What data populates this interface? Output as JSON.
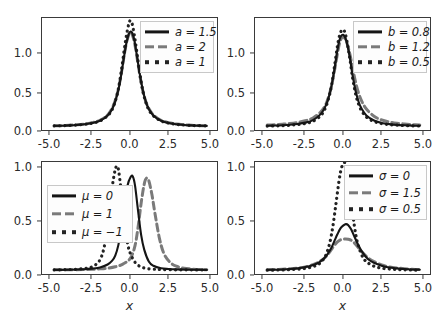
{
  "figure": {
    "background_color": "#ffffff",
    "layout": "2x2 grid of line plots",
    "axis_color": "#3a3a3a"
  },
  "colors": {
    "solid": "#151515",
    "dashed": "#7a7a7a",
    "dotted": "#232323",
    "frame": "#3a3a3a",
    "legend_border": "#c8c8c8",
    "legend_face": "#fdfdfd"
  },
  "chart_data": [
    {
      "type": "line",
      "panel": "top-left",
      "title": "",
      "xlabel": "",
      "ylabel": "",
      "xlim": [
        -5.8,
        5.8
      ],
      "ylim": [
        -0.06,
        1.28
      ],
      "grid": false,
      "legend_position": "upper right",
      "xticks": [
        "-5.0",
        "-2.5",
        "0.0",
        "2.5",
        "5.0"
      ],
      "xtick_values": [
        -5.0,
        -2.5,
        0.0,
        2.5,
        5.0
      ],
      "yticks": [
        "0.0",
        "0.5",
        "1.0"
      ],
      "ytick_values": [
        0.0,
        0.5,
        1.0
      ],
      "series": [
        {
          "name": "a = 1.5",
          "style": "solid",
          "color": "#151515",
          "x": [
            -5.0,
            -4.5,
            -4.0,
            -3.5,
            -3.0,
            -2.5,
            -2.0,
            -1.5,
            -1.2,
            -1.0,
            -0.8,
            -0.6,
            -0.4,
            -0.25,
            -0.1,
            0.0,
            0.1,
            0.25,
            0.4,
            0.6,
            0.8,
            1.0,
            1.2,
            1.5,
            2.0,
            2.5,
            3.0,
            3.5,
            4.0,
            4.5,
            5.0
          ],
          "y": [
            0.012,
            0.014,
            0.018,
            0.023,
            0.031,
            0.045,
            0.072,
            0.135,
            0.21,
            0.3,
            0.43,
            0.62,
            0.85,
            1.0,
            1.1,
            1.12,
            1.11,
            1.02,
            0.86,
            0.63,
            0.44,
            0.3,
            0.21,
            0.135,
            0.072,
            0.045,
            0.031,
            0.023,
            0.018,
            0.014,
            0.012
          ]
        },
        {
          "name": "a = 2",
          "style": "dashed",
          "color": "#7a7a7a",
          "x": [
            -5.0,
            -4.5,
            -4.0,
            -3.5,
            -3.0,
            -2.5,
            -2.0,
            -1.5,
            -1.2,
            -1.0,
            -0.8,
            -0.6,
            -0.4,
            -0.25,
            -0.1,
            0.0,
            0.1,
            0.25,
            0.4,
            0.6,
            0.8,
            1.0,
            1.2,
            1.5,
            2.0,
            2.5,
            3.0,
            3.5,
            4.0,
            4.5,
            5.0
          ],
          "y": [
            0.013,
            0.015,
            0.019,
            0.025,
            0.034,
            0.05,
            0.078,
            0.14,
            0.22,
            0.31,
            0.44,
            0.63,
            0.86,
            1.0,
            1.09,
            1.1,
            1.09,
            1.0,
            0.85,
            0.62,
            0.43,
            0.3,
            0.215,
            0.14,
            0.078,
            0.05,
            0.034,
            0.025,
            0.019,
            0.015,
            0.013
          ]
        },
        {
          "name": "a = 1",
          "style": "dotted",
          "color": "#232323",
          "x": [
            -5.0,
            -4.5,
            -4.0,
            -3.5,
            -3.0,
            -2.5,
            -2.0,
            -1.5,
            -1.2,
            -1.0,
            -0.8,
            -0.6,
            -0.4,
            -0.25,
            -0.1,
            0.0,
            0.1,
            0.25,
            0.4,
            0.6,
            0.8,
            1.0,
            1.2,
            1.5,
            2.0,
            2.5,
            3.0,
            3.5,
            4.0,
            4.5,
            5.0
          ],
          "y": [
            0.012,
            0.014,
            0.017,
            0.022,
            0.03,
            0.044,
            0.07,
            0.13,
            0.205,
            0.3,
            0.44,
            0.66,
            0.92,
            1.09,
            1.22,
            1.25,
            1.22,
            1.08,
            0.9,
            0.64,
            0.43,
            0.29,
            0.2,
            0.13,
            0.07,
            0.044,
            0.03,
            0.022,
            0.017,
            0.014,
            0.012
          ]
        }
      ]
    },
    {
      "type": "line",
      "panel": "top-right",
      "title": "",
      "xlabel": "",
      "ylabel": "",
      "xlim": [
        -5.8,
        5.8
      ],
      "ylim": [
        -0.06,
        1.28
      ],
      "grid": false,
      "legend_position": "upper right",
      "xticks": [
        "-5.0",
        "-2.5",
        "0.0",
        "2.5",
        "5.0"
      ],
      "xtick_values": [
        -5.0,
        -2.5,
        0.0,
        2.5,
        5.0
      ],
      "yticks": [
        "0.0",
        "0.5",
        "1.0"
      ],
      "ytick_values": [
        0.0,
        0.5,
        1.0
      ],
      "series": [
        {
          "name": "b = 0.8",
          "style": "solid",
          "color": "#151515",
          "x": [
            -5.0,
            -4.5,
            -4.0,
            -3.5,
            -3.0,
            -2.5,
            -2.0,
            -1.5,
            -1.2,
            -1.0,
            -0.8,
            -0.6,
            -0.4,
            -0.25,
            -0.1,
            0.05,
            0.2,
            0.4,
            0.6,
            0.8,
            1.0,
            1.2,
            1.5,
            2.0,
            2.5,
            3.0,
            3.5,
            4.0,
            4.5,
            5.0
          ],
          "y": [
            0.013,
            0.016,
            0.02,
            0.026,
            0.035,
            0.05,
            0.08,
            0.15,
            0.235,
            0.33,
            0.47,
            0.67,
            0.9,
            1.03,
            1.08,
            1.07,
            1.0,
            0.83,
            0.6,
            0.42,
            0.29,
            0.21,
            0.135,
            0.075,
            0.047,
            0.033,
            0.024,
            0.019,
            0.015,
            0.013
          ]
        },
        {
          "name": "b = 1.2",
          "style": "dashed",
          "color": "#7a7a7a",
          "x": [
            -5.0,
            -4.5,
            -4.0,
            -3.5,
            -3.0,
            -2.5,
            -2.0,
            -1.5,
            -1.2,
            -1.0,
            -0.8,
            -0.6,
            -0.4,
            -0.25,
            -0.1,
            0.05,
            0.2,
            0.4,
            0.6,
            0.8,
            1.0,
            1.2,
            1.5,
            2.0,
            2.5,
            3.0,
            3.5,
            4.0,
            4.5,
            5.0
          ],
          "y": [
            0.022,
            0.026,
            0.032,
            0.04,
            0.053,
            0.072,
            0.105,
            0.175,
            0.25,
            0.34,
            0.47,
            0.65,
            0.86,
            0.99,
            1.05,
            1.05,
            1.0,
            0.87,
            0.69,
            0.52,
            0.39,
            0.3,
            0.21,
            0.125,
            0.082,
            0.058,
            0.043,
            0.034,
            0.027,
            0.022
          ]
        },
        {
          "name": "b = 0.5",
          "style": "dotted",
          "color": "#232323",
          "x": [
            -5.0,
            -4.5,
            -4.0,
            -3.5,
            -3.0,
            -2.5,
            -2.0,
            -1.5,
            -1.2,
            -1.0,
            -0.8,
            -0.6,
            -0.4,
            -0.25,
            -0.1,
            0.05,
            0.2,
            0.4,
            0.6,
            0.8,
            1.0,
            1.2,
            1.5,
            2.0,
            2.5,
            3.0,
            3.5,
            4.0,
            4.5,
            5.0
          ],
          "y": [
            0.01,
            0.012,
            0.015,
            0.02,
            0.027,
            0.04,
            0.066,
            0.13,
            0.215,
            0.32,
            0.47,
            0.7,
            0.95,
            1.08,
            1.14,
            1.13,
            1.03,
            0.82,
            0.57,
            0.38,
            0.26,
            0.185,
            0.115,
            0.063,
            0.039,
            0.027,
            0.02,
            0.015,
            0.012,
            0.01
          ]
        }
      ]
    },
    {
      "type": "line",
      "panel": "bottom-left",
      "title": "",
      "xlabel": "x",
      "ylabel": "",
      "xlim": [
        -5.8,
        5.8
      ],
      "ylim": [
        -0.06,
        1.28
      ],
      "grid": false,
      "legend_position": "upper left",
      "xticks": [
        "-5.0",
        "-2.5",
        "0.0",
        "2.5",
        "5.0"
      ],
      "xtick_values": [
        -5.0,
        -2.5,
        0.0,
        2.5,
        5.0
      ],
      "yticks": [
        "0.0",
        "0.5",
        "1.0"
      ],
      "ytick_values": [
        0.0,
        0.5,
        1.0
      ],
      "series": [
        {
          "name": "μ = 0",
          "style": "solid",
          "color": "#151515",
          "x": [
            -5.0,
            -4.0,
            -3.0,
            -2.5,
            -2.0,
            -1.5,
            -1.2,
            -1.0,
            -0.8,
            -0.6,
            -0.4,
            -0.2,
            0.0,
            0.15,
            0.3,
            0.5,
            0.7,
            0.9,
            1.2,
            1.5,
            2.0,
            2.5,
            3.0,
            4.0,
            5.0
          ],
          "y": [
            0.012,
            0.014,
            0.02,
            0.027,
            0.04,
            0.075,
            0.12,
            0.18,
            0.3,
            0.5,
            0.78,
            1.0,
            1.1,
            1.11,
            1.0,
            0.7,
            0.42,
            0.25,
            0.11,
            0.06,
            0.03,
            0.022,
            0.018,
            0.014,
            0.012
          ]
        },
        {
          "name": "μ = 1",
          "style": "dashed",
          "color": "#7a7a7a",
          "x": [
            -5.0,
            -4.0,
            -3.0,
            -2.5,
            -2.0,
            -1.5,
            -1.0,
            -0.5,
            0.0,
            0.3,
            0.5,
            0.7,
            0.9,
            1.05,
            1.2,
            1.4,
            1.6,
            1.9,
            2.2,
            2.6,
            3.0,
            3.5,
            4.0,
            4.5,
            5.0
          ],
          "y": [
            0.012,
            0.013,
            0.016,
            0.019,
            0.024,
            0.032,
            0.048,
            0.08,
            0.15,
            0.3,
            0.52,
            0.8,
            1.02,
            1.09,
            1.06,
            0.9,
            0.68,
            0.38,
            0.2,
            0.1,
            0.055,
            0.032,
            0.022,
            0.016,
            0.013
          ]
        },
        {
          "name": "μ = −1",
          "style": "dotted",
          "color": "#232323",
          "x": [
            -5.0,
            -4.5,
            -4.0,
            -3.5,
            -3.0,
            -2.6,
            -2.3,
            -2.0,
            -1.75,
            -1.5,
            -1.3,
            -1.1,
            -0.95,
            -0.8,
            -0.6,
            -0.4,
            -0.2,
            0.0,
            0.3,
            0.6,
            1.0,
            1.5,
            2.0,
            3.0,
            4.0,
            5.0
          ],
          "y": [
            0.012,
            0.013,
            0.016,
            0.02,
            0.028,
            0.042,
            0.07,
            0.13,
            0.26,
            0.52,
            0.85,
            1.1,
            1.22,
            1.2,
            0.92,
            0.6,
            0.33,
            0.2,
            0.1,
            0.055,
            0.03,
            0.02,
            0.016,
            0.013,
            0.012,
            0.012
          ]
        }
      ]
    },
    {
      "type": "line",
      "panel": "bottom-right",
      "title": "",
      "xlabel": "x",
      "ylabel": "",
      "xlim": [
        -5.8,
        5.8
      ],
      "ylim": [
        -0.06,
        1.28
      ],
      "grid": false,
      "legend_position": "upper right",
      "xticks": [
        "-5.0",
        "-2.5",
        "0.0",
        "2.5",
        "5.0"
      ],
      "xtick_values": [
        -5.0,
        -2.5,
        0.0,
        2.5,
        5.0
      ],
      "yticks": [
        "0.0",
        "0.5",
        "1.0"
      ],
      "ytick_values": [
        0.0,
        0.5,
        1.0
      ],
      "series": [
        {
          "name": "σ = 0",
          "style": "solid",
          "color": "#151515",
          "x": [
            -5.0,
            -4.5,
            -4.0,
            -3.5,
            -3.0,
            -2.5,
            -2.0,
            -1.6,
            -1.2,
            -1.0,
            -0.8,
            -0.6,
            -0.4,
            -0.2,
            0.0,
            0.15,
            0.3,
            0.5,
            0.7,
            0.9,
            1.2,
            1.6,
            2.0,
            2.5,
            3.0,
            3.5,
            4.0,
            4.5,
            5.0
          ],
          "y": [
            0.012,
            0.014,
            0.017,
            0.022,
            0.03,
            0.045,
            0.07,
            0.1,
            0.16,
            0.21,
            0.27,
            0.35,
            0.43,
            0.5,
            0.535,
            0.55,
            0.54,
            0.49,
            0.41,
            0.33,
            0.23,
            0.14,
            0.095,
            0.06,
            0.04,
            0.03,
            0.022,
            0.017,
            0.014
          ]
        },
        {
          "name": "σ = 1.5",
          "style": "dashed",
          "color": "#7a7a7a",
          "x": [
            -5.0,
            -4.5,
            -4.0,
            -3.5,
            -3.0,
            -2.5,
            -2.0,
            -1.6,
            -1.2,
            -1.0,
            -0.8,
            -0.6,
            -0.4,
            -0.2,
            0.0,
            0.15,
            0.3,
            0.5,
            0.7,
            0.9,
            1.2,
            1.6,
            2.0,
            2.5,
            3.0,
            3.5,
            4.0,
            4.5,
            5.0
          ],
          "y": [
            0.014,
            0.016,
            0.02,
            0.025,
            0.033,
            0.047,
            0.073,
            0.105,
            0.16,
            0.2,
            0.25,
            0.3,
            0.34,
            0.365,
            0.372,
            0.375,
            0.372,
            0.36,
            0.33,
            0.29,
            0.225,
            0.155,
            0.11,
            0.07,
            0.048,
            0.035,
            0.026,
            0.02,
            0.016
          ]
        },
        {
          "name": "σ = 0.5",
          "style": "dotted",
          "color": "#232323",
          "x": [
            -5.0,
            -4.5,
            -4.0,
            -3.5,
            -3.0,
            -2.5,
            -2.0,
            -1.6,
            -1.3,
            -1.1,
            -0.9,
            -0.7,
            -0.5,
            -0.3,
            -0.15,
            0.0,
            0.1,
            0.25,
            0.4,
            0.6,
            0.8,
            1.0,
            1.3,
            1.6,
            2.0,
            2.5,
            3.0,
            3.5,
            4.0,
            4.5,
            5.0
          ],
          "y": [
            0.008,
            0.01,
            0.012,
            0.015,
            0.02,
            0.03,
            0.05,
            0.082,
            0.14,
            0.21,
            0.33,
            0.52,
            0.78,
            1.05,
            1.2,
            1.26,
            1.27,
            1.2,
            1.0,
            0.68,
            0.43,
            0.28,
            0.15,
            0.095,
            0.055,
            0.032,
            0.022,
            0.016,
            0.013,
            0.01,
            0.008
          ]
        }
      ]
    }
  ]
}
